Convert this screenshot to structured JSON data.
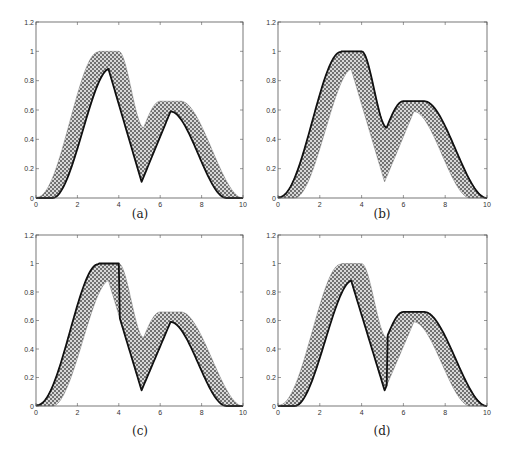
{
  "figure": {
    "panels": [
      {
        "id": "a",
        "caption": "(a)",
        "bold_line": "lower"
      },
      {
        "id": "b",
        "caption": "(b)",
        "bold_line": "upper"
      },
      {
        "id": "c",
        "caption": "(c)",
        "bold_line": "upper-then-lower-at-x4"
      },
      {
        "id": "d",
        "caption": "(d)",
        "bold_line": "lower-then-upper-at-x5.2"
      }
    ],
    "colors": {
      "axis": "#555555",
      "bold_line": "#111111",
      "fill_bg": "#d8d8d8",
      "fill_dot": "#222222"
    }
  },
  "chart_data": [
    {
      "type": "area",
      "panel": "(a)",
      "title": "",
      "xlabel": "",
      "ylabel": "",
      "xlim": [
        0,
        10
      ],
      "ylim": [
        0,
        1.2
      ],
      "xticks": [
        0,
        2,
        4,
        6,
        8,
        10
      ],
      "yticks": [
        0,
        0.2,
        0.4,
        0.6,
        0.8,
        1,
        1.2
      ],
      "xtick_labels": [
        "0",
        "2",
        "4",
        "6",
        "8",
        "10"
      ],
      "ytick_labels": [
        "0",
        "0.2",
        "0.4",
        "0.6",
        "0.8",
        "1",
        "1.2"
      ],
      "grid": false,
      "series": [
        {
          "name": "upper envelope",
          "x": [
            0,
            1,
            2,
            3,
            4,
            5.2,
            6,
            7,
            8,
            9,
            10
          ],
          "values": [
            0.01,
            0.12,
            0.55,
            1.0,
            1.0,
            0.48,
            0.66,
            0.66,
            0.38,
            0.07,
            0
          ]
        },
        {
          "name": "lower envelope",
          "x": [
            0,
            0.8,
            1.5,
            2.5,
            3.5,
            5.1,
            6.5,
            7.5,
            8.5,
            9.2,
            10
          ],
          "values": [
            0,
            0,
            0.1,
            0.5,
            0.88,
            0.11,
            0.59,
            0.36,
            0.07,
            0,
            0
          ]
        },
        {
          "name": "bold trajectory",
          "follows": "lower envelope"
        }
      ]
    },
    {
      "type": "area",
      "panel": "(b)",
      "xlim": [
        0,
        10
      ],
      "ylim": [
        0,
        1.2
      ],
      "xticks": [
        0,
        2,
        4,
        6,
        8,
        10
      ],
      "yticks": [
        0,
        0.2,
        0.4,
        0.6,
        0.8,
        1,
        1.2
      ],
      "series": [
        {
          "name": "upper envelope",
          "x": [
            0,
            1,
            2,
            3,
            4,
            5.2,
            6,
            7,
            8,
            9,
            10
          ],
          "values": [
            0.01,
            0.12,
            0.55,
            1.0,
            1.0,
            0.48,
            0.66,
            0.66,
            0.38,
            0.07,
            0
          ]
        },
        {
          "name": "lower envelope",
          "x": [
            0,
            0.8,
            1.5,
            2.5,
            3.5,
            5.1,
            6.5,
            7.5,
            8.5,
            9.2,
            10
          ],
          "values": [
            0,
            0,
            0.1,
            0.5,
            0.88,
            0.11,
            0.59,
            0.36,
            0.07,
            0,
            0
          ]
        },
        {
          "name": "bold trajectory",
          "follows": "upper envelope"
        }
      ]
    },
    {
      "type": "area",
      "panel": "(c)",
      "xlim": [
        0,
        10
      ],
      "ylim": [
        0,
        1.2
      ],
      "xticks": [
        0,
        2,
        4,
        6,
        8,
        10
      ],
      "yticks": [
        0,
        0.2,
        0.4,
        0.6,
        0.8,
        1,
        1.2
      ],
      "series": [
        {
          "name": "upper envelope",
          "x": [
            0,
            1,
            2,
            3,
            4,
            5.2,
            6,
            7,
            8,
            9,
            10
          ],
          "values": [
            0.01,
            0.12,
            0.55,
            1.0,
            1.0,
            0.48,
            0.66,
            0.66,
            0.38,
            0.07,
            0
          ]
        },
        {
          "name": "lower envelope",
          "x": [
            0,
            0.8,
            1.5,
            2.5,
            3.5,
            5.1,
            6.5,
            7.5,
            8.5,
            9.2,
            10
          ],
          "values": [
            0,
            0,
            0.1,
            0.5,
            0.88,
            0.11,
            0.59,
            0.36,
            0.07,
            0,
            0
          ]
        },
        {
          "name": "bold trajectory",
          "follows": "upper envelope until x=4, vertical drop to lower envelope, then lower envelope"
        }
      ]
    },
    {
      "type": "area",
      "panel": "(d)",
      "xlim": [
        0,
        10
      ],
      "ylim": [
        0,
        1.2
      ],
      "xticks": [
        0,
        2,
        4,
        6,
        8,
        10
      ],
      "yticks": [
        0,
        0.2,
        0.4,
        0.6,
        0.8,
        1,
        1.2
      ],
      "series": [
        {
          "name": "upper envelope",
          "x": [
            0,
            1,
            2,
            3,
            4,
            5.2,
            6,
            7,
            8,
            9,
            10
          ],
          "values": [
            0.01,
            0.12,
            0.55,
            1.0,
            1.0,
            0.48,
            0.66,
            0.66,
            0.38,
            0.07,
            0
          ]
        },
        {
          "name": "lower envelope",
          "x": [
            0,
            0.8,
            1.5,
            2.5,
            3.5,
            5.1,
            6.5,
            7.5,
            8.5,
            9.2,
            10
          ],
          "values": [
            0,
            0,
            0.1,
            0.5,
            0.88,
            0.11,
            0.59,
            0.36,
            0.07,
            0,
            0
          ]
        },
        {
          "name": "bold trajectory",
          "follows": "lower envelope until x≈5.2, vertical rise to upper envelope, then upper envelope"
        }
      ]
    }
  ]
}
